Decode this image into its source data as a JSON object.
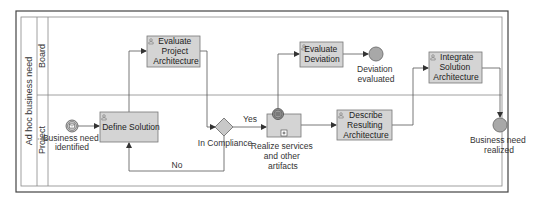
{
  "pool": {
    "label": "Ad hoc business need",
    "lanes": [
      {
        "label": "Board"
      },
      {
        "label": "Project"
      }
    ]
  },
  "events": {
    "start": {
      "label_lines": [
        "Business need",
        "identified"
      ],
      "type": "message-start"
    },
    "deviation_end": {
      "label_lines": [
        "Deviation",
        "evaluated"
      ],
      "type": "end"
    },
    "final_end": {
      "label_lines": [
        "Business need",
        "realized"
      ],
      "type": "end"
    }
  },
  "tasks": {
    "define_solution": {
      "label_lines": [
        "Define Solution"
      ],
      "type": "user-task"
    },
    "evaluate_project_architecture": {
      "label_lines": [
        "Evaluate",
        "Project",
        "Architecture"
      ],
      "type": "user-task"
    },
    "evaluate_deviation": {
      "label_lines": [
        "Evaluate",
        "Deviation"
      ],
      "type": "user-task"
    },
    "describe_resulting_architecture": {
      "label_lines": [
        "Describe",
        "Resulting",
        "Architecture"
      ],
      "type": "user-task"
    },
    "integrate_solution_architecture": {
      "label_lines": [
        "Integrate",
        "Solution",
        "Architecture"
      ],
      "type": "user-task"
    }
  },
  "subprocess": {
    "realize": {
      "label_lines": [
        "Realize services",
        "and other",
        "artifacts"
      ],
      "marker": "+"
    }
  },
  "gateway": {
    "compliance": {
      "label": "In Compliance",
      "yes_label": "Yes",
      "no_label": "No"
    }
  },
  "colors": {
    "task_fill": "#d4d4d4",
    "task_stroke": "#777777",
    "event_fill": "#a8a8a8",
    "line": "#555555",
    "frame": "#444444"
  }
}
